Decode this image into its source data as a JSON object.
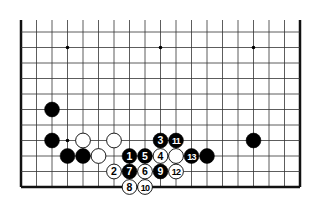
{
  "diagram": {
    "type": "go-board-fragment",
    "grid": {
      "columns": 19,
      "rows_visible": 11,
      "origin_x": 21,
      "origin_y": 32,
      "spacing": 15.5,
      "top_open": true,
      "left_edge": true,
      "right_edge": true,
      "bottom_edge": true
    },
    "star_points": [
      {
        "c": 3,
        "r": 1
      },
      {
        "c": 9,
        "r": 1
      },
      {
        "c": 15,
        "r": 1
      },
      {
        "c": 3,
        "r": 7
      }
    ],
    "stones": [
      {
        "c": 2,
        "r": 5,
        "color": "black",
        "label": ""
      },
      {
        "c": 2,
        "r": 7,
        "color": "black",
        "label": ""
      },
      {
        "c": 4,
        "r": 7,
        "color": "white",
        "label": ""
      },
      {
        "c": 6,
        "r": 7,
        "color": "white",
        "label": ""
      },
      {
        "c": 3,
        "r": 8,
        "color": "black",
        "label": ""
      },
      {
        "c": 4,
        "r": 8,
        "color": "black",
        "label": ""
      },
      {
        "c": 5,
        "r": 8,
        "color": "white",
        "label": ""
      },
      {
        "c": 15,
        "r": 7,
        "color": "black",
        "label": ""
      },
      {
        "c": 9,
        "r": 7,
        "color": "black",
        "label": "3"
      },
      {
        "c": 10,
        "r": 7,
        "color": "black",
        "label": "11"
      },
      {
        "c": 7,
        "r": 8,
        "color": "black",
        "label": "1"
      },
      {
        "c": 8,
        "r": 8,
        "color": "black",
        "label": "5"
      },
      {
        "c": 9,
        "r": 8,
        "color": "white",
        "label": "4"
      },
      {
        "c": 10,
        "r": 8,
        "color": "white",
        "label": ""
      },
      {
        "c": 11,
        "r": 8,
        "color": "black",
        "label": "13"
      },
      {
        "c": 12,
        "r": 8,
        "color": "black",
        "label": ""
      },
      {
        "c": 6,
        "r": 9,
        "color": "white",
        "label": "2"
      },
      {
        "c": 7,
        "r": 9,
        "color": "black",
        "label": "7"
      },
      {
        "c": 8,
        "r": 9,
        "color": "white",
        "label": "6"
      },
      {
        "c": 9,
        "r": 9,
        "color": "black",
        "label": "9"
      },
      {
        "c": 10,
        "r": 9,
        "color": "white",
        "label": "12"
      },
      {
        "c": 7,
        "r": 10,
        "color": "white",
        "label": "8"
      },
      {
        "c": 8,
        "r": 10,
        "color": "white",
        "label": "10"
      }
    ],
    "colors": {
      "line": "#333333",
      "border": "#111111",
      "black_stone": "#000000",
      "white_stone": "#ffffff",
      "background": "#ffffff"
    }
  }
}
